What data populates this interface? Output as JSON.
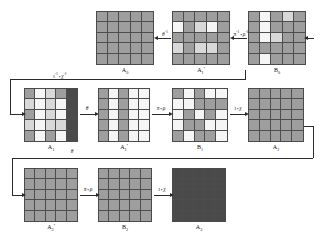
{
  "diagram": {
    "grid_size": 5,
    "palette": {
      "gray": "#9e9e9e",
      "light": "#d8d8d8",
      "white": "#f5f5f5",
      "dark": "#4a4a4a",
      "charcoal": "#4d4d4d",
      "line": "#2b2b2b",
      "background": "#ffffff"
    }
  },
  "rows": [
    {
      "id": "row-0",
      "blocks": [
        {
          "id": "A0",
          "label": "A",
          "sub": "0",
          "prime": "",
          "x": 96,
          "y": 11,
          "w": 58,
          "h": 54,
          "cells": [
            [
              "gray",
              "gray",
              "gray",
              "gray",
              "gray"
            ],
            [
              "gray",
              "gray",
              "gray",
              "gray",
              "gray"
            ],
            [
              "gray",
              "gray",
              "gray",
              "gray",
              "gray"
            ],
            [
              "gray",
              "gray",
              "gray",
              "gray",
              "gray"
            ],
            [
              "gray",
              "gray",
              "gray",
              "gray",
              "gray"
            ]
          ]
        },
        {
          "id": "A1p",
          "label": "A",
          "sub": "1",
          "prime": "'",
          "x": 172,
          "y": 11,
          "w": 58,
          "h": 54,
          "cells": [
            [
              "gray",
              "gray",
              "gray",
              "gray",
              "gray"
            ],
            [
              "white",
              "gray",
              "light",
              "white",
              "gray"
            ],
            [
              "gray",
              "gray",
              "gray",
              "gray",
              "gray"
            ],
            [
              "light",
              "gray",
              "light",
              "light",
              "gray"
            ],
            [
              "gray",
              "gray",
              "gray",
              "gray",
              "gray"
            ]
          ]
        },
        {
          "id": "B0",
          "label": "B",
          "sub": "0",
          "prime": "",
          "x": 248,
          "y": 11,
          "w": 58,
          "h": 54,
          "cells": [
            [
              "gray",
              "white",
              "gray",
              "light",
              "gray"
            ],
            [
              "gray",
              "white",
              "gray",
              "gray",
              "gray"
            ],
            [
              "gray",
              "white",
              "light",
              "gray",
              "gray"
            ],
            [
              "gray",
              "gray",
              "gray",
              "gray",
              "gray"
            ],
            [
              "gray",
              "white",
              "gray",
              "gray",
              "gray"
            ]
          ]
        }
      ]
    },
    {
      "id": "row-1",
      "blocks": [
        {
          "id": "A1",
          "label": "A",
          "sub": "1",
          "prime": "",
          "x": 24,
          "y": 88,
          "w": 54,
          "h": 54,
          "cells": [
            [
              "gray",
              "white",
              "light",
              "gray",
              "dark"
            ],
            [
              "light",
              "white",
              "light",
              "white",
              "dark"
            ],
            [
              "gray",
              "white",
              "light",
              "white",
              "dark"
            ],
            [
              "light",
              "white",
              "light",
              "light",
              "dark"
            ],
            [
              "gray",
              "white",
              "gray",
              "white",
              "dark"
            ]
          ]
        },
        {
          "id": "A1p_b",
          "label": "A",
          "sub": "1",
          "prime": "'",
          "x": 98,
          "y": 88,
          "w": 52,
          "h": 54,
          "cells": [
            [
              "gray",
              "white",
              "gray",
              "white",
              "white"
            ],
            [
              "gray",
              "white",
              "gray",
              "white",
              "white"
            ],
            [
              "gray",
              "white",
              "gray",
              "white",
              "white"
            ],
            [
              "gray",
              "white",
              "gray",
              "white",
              "white"
            ],
            [
              "gray",
              "white",
              "gray",
              "white",
              "white"
            ]
          ]
        },
        {
          "id": "B1",
          "label": "B",
          "sub": "1",
          "prime": "",
          "x": 172,
          "y": 88,
          "w": 56,
          "h": 54,
          "cells": [
            [
              "gray",
              "white",
              "gray",
              "white",
              "white"
            ],
            [
              "white",
              "white",
              "gray",
              "gray",
              "gray"
            ],
            [
              "white",
              "gray",
              "white",
              "gray",
              "white"
            ],
            [
              "white",
              "gray",
              "gray",
              "white",
              "white"
            ],
            [
              "gray",
              "white",
              "gray",
              "gray",
              "white"
            ]
          ]
        },
        {
          "id": "A2",
          "label": "A",
          "sub": "2",
          "prime": "",
          "x": 248,
          "y": 88,
          "w": 56,
          "h": 54,
          "cells": [
            [
              "gray",
              "gray",
              "gray",
              "gray",
              "gray"
            ],
            [
              "gray",
              "gray",
              "gray",
              "gray",
              "gray"
            ],
            [
              "gray",
              "gray",
              "gray",
              "gray",
              "gray"
            ],
            [
              "gray",
              "gray",
              "gray",
              "gray",
              "gray"
            ],
            [
              "gray",
              "gray",
              "gray",
              "gray",
              "gray"
            ]
          ]
        }
      ]
    },
    {
      "id": "row-2",
      "blocks": [
        {
          "id": "A2p",
          "label": "A",
          "sub": "2",
          "prime": "'",
          "x": 24,
          "y": 168,
          "w": 54,
          "h": 54,
          "cells": [
            [
              "gray",
              "gray",
              "gray",
              "gray",
              "gray"
            ],
            [
              "gray",
              "gray",
              "gray",
              "gray",
              "gray"
            ],
            [
              "gray",
              "gray",
              "gray",
              "gray",
              "gray"
            ],
            [
              "gray",
              "gray",
              "gray",
              "gray",
              "gray"
            ],
            [
              "gray",
              "gray",
              "gray",
              "gray",
              "gray"
            ]
          ]
        },
        {
          "id": "B2",
          "label": "B",
          "sub": "2",
          "prime": "",
          "x": 98,
          "y": 168,
          "w": 54,
          "h": 54,
          "cells": [
            [
              "gray",
              "gray",
              "gray",
              "gray",
              "gray"
            ],
            [
              "gray",
              "gray",
              "gray",
              "gray",
              "gray"
            ],
            [
              "gray",
              "gray",
              "gray",
              "gray",
              "gray"
            ],
            [
              "gray",
              "gray",
              "gray",
              "gray",
              "gray"
            ],
            [
              "gray",
              "gray",
              "gray",
              "gray",
              "gray"
            ]
          ]
        },
        {
          "id": "A3",
          "label": "A",
          "sub": "3",
          "prime": "",
          "x": 172,
          "y": 168,
          "w": 54,
          "h": 54,
          "cells": [
            [
              "dark",
              "dark",
              "dark",
              "dark",
              "dark"
            ],
            [
              "dark",
              "dark",
              "dark",
              "dark",
              "dark"
            ],
            [
              "dark",
              "dark",
              "dark",
              "dark",
              "dark"
            ],
            [
              "dark",
              "dark",
              "dark",
              "dark",
              "dark"
            ],
            [
              "dark",
              "dark",
              "dark",
              "dark",
              "dark"
            ]
          ]
        }
      ]
    }
  ],
  "arrows": [
    {
      "id": "arrow-theta-inv",
      "label_main": "θ",
      "label_sup": "-1",
      "label_op": "",
      "label_second": "",
      "label_sup2": ""
    },
    {
      "id": "arrow-pi-rho-inv",
      "label_main": "π",
      "label_sup": "-1",
      "label_op": "∘",
      "label_second": "ρ",
      "label_sup2": "-1"
    },
    {
      "id": "arrow-rho-pi-inv",
      "label_main": "ι",
      "label_sup": "-1",
      "label_op": "∘",
      "label_second": "χ",
      "label_sup2": "-1"
    },
    {
      "id": "arrow-theta-1",
      "label_main": "θ",
      "label_sup": "",
      "label_op": "",
      "label_second": "",
      "label_sup2": ""
    },
    {
      "id": "arrow-pi-rho-1",
      "label_main": "π",
      "label_sup": "",
      "label_op": "∘",
      "label_second": "ρ",
      "label_sup2": ""
    },
    {
      "id": "arrow-iota-chi-1",
      "label_main": "ι",
      "label_sup": "",
      "label_op": "∘",
      "label_second": "χ",
      "label_sup2": ""
    },
    {
      "id": "arrow-theta-2",
      "label_main": "θ",
      "label_sup": "",
      "label_op": "",
      "label_second": "",
      "label_sup2": ""
    },
    {
      "id": "arrow-pi-rho-2",
      "label_main": "π",
      "label_sup": "",
      "label_op": "∘",
      "label_second": "ρ",
      "label_sup2": ""
    },
    {
      "id": "arrow-iota-chi-2",
      "label_main": "ι",
      "label_sup": "",
      "label_op": "∘",
      "label_second": "χ",
      "label_sup2": ""
    }
  ]
}
